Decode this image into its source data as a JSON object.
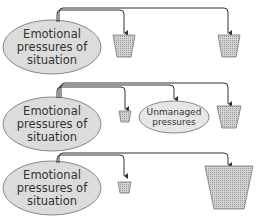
{
  "diagram": {
    "colors": {
      "ellipse_fill": "#dcdcdc",
      "ellipse_stroke": "#888888",
      "line": "#333333",
      "bucket_fill": "#c8c8c8",
      "bucket_stroke": "#777777"
    },
    "rows": [
      {
        "source_label_lines": [
          "Emotional",
          "pressures of",
          "situation"
        ],
        "targets": [
          {
            "type": "bucket",
            "size": "medium"
          },
          {
            "type": "bucket",
            "size": "medium"
          }
        ]
      },
      {
        "source_label_lines": [
          "Emotional",
          "pressures of",
          "situation"
        ],
        "targets": [
          {
            "type": "bucket",
            "size": "small"
          },
          {
            "type": "ellipse",
            "label_lines": [
              "Unmanaged",
              "pressures"
            ]
          },
          {
            "type": "bucket",
            "size": "medium"
          }
        ]
      },
      {
        "source_label_lines": [
          "Emotional",
          "pressures of",
          "situation"
        ],
        "targets": [
          {
            "type": "bucket",
            "size": "small"
          },
          {
            "type": "bucket",
            "size": "large"
          }
        ]
      }
    ]
  }
}
